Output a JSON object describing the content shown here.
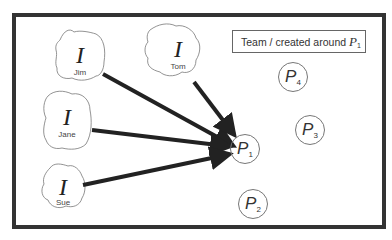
{
  "diagram": {
    "legend": {
      "text": "Team / created around ",
      "symbol": "P",
      "subscript": "1"
    },
    "members": [
      {
        "name": "Jim",
        "symbol": "I"
      },
      {
        "name": "Tom",
        "symbol": "I"
      },
      {
        "name": "Jane",
        "symbol": "I"
      },
      {
        "name": "Sue",
        "symbol": "I"
      }
    ],
    "projects": [
      {
        "symbol": "P",
        "subscript": "1"
      },
      {
        "symbol": "P",
        "subscript": "2"
      },
      {
        "symbol": "P",
        "subscript": "3"
      },
      {
        "symbol": "P",
        "subscript": "4"
      }
    ],
    "edges": [
      {
        "from": "Jim",
        "to": "P1"
      },
      {
        "from": "Tom",
        "to": "P1"
      },
      {
        "from": "Jane",
        "to": "P1"
      },
      {
        "from": "Sue",
        "to": "P1"
      }
    ]
  }
}
